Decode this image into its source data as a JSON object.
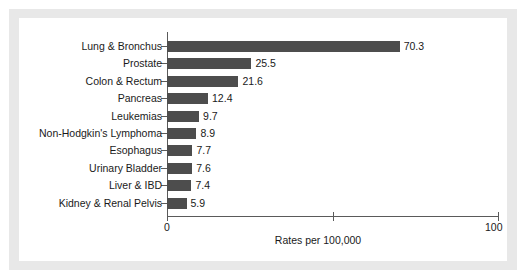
{
  "chart_data": {
    "type": "bar",
    "orientation": "horizontal",
    "title": "",
    "subtitle": "",
    "xlabel": "Rates per 100,000",
    "ylabel": "",
    "xlim": [
      0,
      100
    ],
    "xticks": [
      0,
      50,
      100
    ],
    "xticklabels": [
      "0",
      "",
      "100"
    ],
    "grid": false,
    "legend": null,
    "bar_color": "#4d4d4d",
    "axis_color": "#5a5a5a",
    "text_color": "#1a1a1a",
    "frame_color": "#e8e8e8",
    "background_color": "#ffffff",
    "show_value_labels": true,
    "categories": [
      "Lung & Bronchus",
      "Prostate",
      "Colon & Rectum",
      "Pancreas",
      "Leukemias",
      "Non-Hodgkin's Lymphoma",
      "Esophagus",
      "Urinary Bladder",
      "Liver & IBD",
      "Kidney & Renal Pelvis"
    ],
    "values": [
      70.3,
      25.5,
      21.6,
      12.4,
      9.7,
      8.9,
      7.7,
      7.6,
      7.4,
      5.9
    ],
    "value_labels": [
      "70.3",
      "25.5",
      "21.6",
      "12.4",
      "9.7",
      "8.9",
      "7.7",
      "7.6",
      "7.4",
      "5.9"
    ]
  }
}
